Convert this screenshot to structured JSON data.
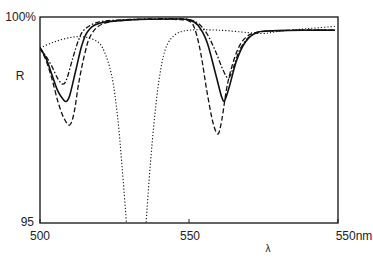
{
  "chart_data": {
    "type": "line",
    "title": "",
    "xlabel": "λ",
    "ylabel": "R",
    "xlim": [
      500,
      600
    ],
    "ylim": [
      95,
      100
    ],
    "x_ticks": [
      {
        "value": 500,
        "label": "500"
      },
      {
        "value": 550,
        "label": "550"
      },
      {
        "value": 600,
        "label": "550nm"
      }
    ],
    "y_ticks": [
      {
        "value": 100,
        "label": "100%"
      },
      {
        "value": 95,
        "label": "95"
      }
    ],
    "grid": false,
    "legend": null,
    "series": [
      {
        "name": "dotted",
        "style": "dotted",
        "points": [
          [
            500,
            99.25
          ],
          [
            505,
            99.4
          ],
          [
            510,
            99.5
          ],
          [
            514,
            99.52
          ],
          [
            518,
            99.45
          ],
          [
            521,
            99.25
          ],
          [
            524,
            98.6
          ],
          [
            526,
            97.6
          ],
          [
            527.5,
            96.4
          ],
          [
            529,
            95.0
          ],
          [
            529.3,
            94.5
          ],
          [
            535.3,
            94.5
          ],
          [
            535.6,
            95.0
          ],
          [
            537,
            96.4
          ],
          [
            538.5,
            97.6
          ],
          [
            540,
            98.5
          ],
          [
            542,
            99.2
          ],
          [
            545,
            99.55
          ],
          [
            550,
            99.68
          ],
          [
            560,
            99.68
          ],
          [
            570,
            99.62
          ],
          [
            575,
            99.6
          ],
          [
            580,
            99.65
          ],
          [
            590,
            99.72
          ],
          [
            599,
            99.77
          ]
        ]
      },
      {
        "name": "solid",
        "style": "solid",
        "points": [
          [
            500,
            99.25
          ],
          [
            502,
            99.0
          ],
          [
            504,
            98.6
          ],
          [
            506,
            98.2
          ],
          [
            508,
            97.98
          ],
          [
            509,
            97.96
          ],
          [
            510,
            98.1
          ],
          [
            512,
            98.7
          ],
          [
            514,
            99.3
          ],
          [
            516,
            99.65
          ],
          [
            520,
            99.85
          ],
          [
            530,
            99.93
          ],
          [
            545,
            99.95
          ],
          [
            550,
            99.93
          ],
          [
            553,
            99.8
          ],
          [
            556,
            99.4
          ],
          [
            559,
            98.6
          ],
          [
            561,
            98.05
          ],
          [
            562,
            97.98
          ],
          [
            563.5,
            98.3
          ],
          [
            566,
            98.95
          ],
          [
            569,
            99.4
          ],
          [
            573,
            99.63
          ],
          [
            580,
            99.67
          ],
          [
            590,
            99.68
          ],
          [
            599,
            99.68
          ]
        ]
      },
      {
        "name": "dash-dot",
        "style": "dash-dot",
        "points": [
          [
            500,
            99.25
          ],
          [
            502,
            99.05
          ],
          [
            504,
            98.8
          ],
          [
            506,
            98.5
          ],
          [
            507.7,
            98.37
          ],
          [
            509,
            98.5
          ],
          [
            511,
            99.0
          ],
          [
            513,
            99.45
          ],
          [
            515,
            99.7
          ],
          [
            520,
            99.88
          ],
          [
            530,
            99.94
          ],
          [
            545,
            99.96
          ],
          [
            550,
            99.94
          ],
          [
            553,
            99.85
          ],
          [
            556,
            99.6
          ],
          [
            559,
            99.15
          ],
          [
            561.5,
            98.7
          ],
          [
            563.3,
            98.52
          ],
          [
            565,
            98.8
          ],
          [
            567,
            99.2
          ],
          [
            570,
            99.5
          ],
          [
            574,
            99.64
          ],
          [
            580,
            99.67
          ],
          [
            590,
            99.68
          ],
          [
            599,
            99.68
          ]
        ]
      },
      {
        "name": "dashed",
        "style": "dashed",
        "points": [
          [
            500,
            99.25
          ],
          [
            502,
            98.95
          ],
          [
            504,
            98.5
          ],
          [
            506,
            97.95
          ],
          [
            508,
            97.55
          ],
          [
            510,
            97.38
          ],
          [
            511.5,
            97.7
          ],
          [
            513,
            98.4
          ],
          [
            515,
            99.1
          ],
          [
            517,
            99.55
          ],
          [
            521,
            99.83
          ],
          [
            530,
            99.93
          ],
          [
            545,
            99.94
          ],
          [
            550,
            99.9
          ],
          [
            552,
            99.7
          ],
          [
            554,
            99.1
          ],
          [
            556,
            98.2
          ],
          [
            558,
            97.45
          ],
          [
            559.7,
            97.16
          ],
          [
            561,
            97.5
          ],
          [
            563,
            98.4
          ],
          [
            566,
            99.15
          ],
          [
            569,
            99.5
          ],
          [
            573,
            99.63
          ],
          [
            580,
            99.67
          ],
          [
            590,
            99.68
          ],
          [
            599,
            99.68
          ]
        ]
      }
    ]
  }
}
